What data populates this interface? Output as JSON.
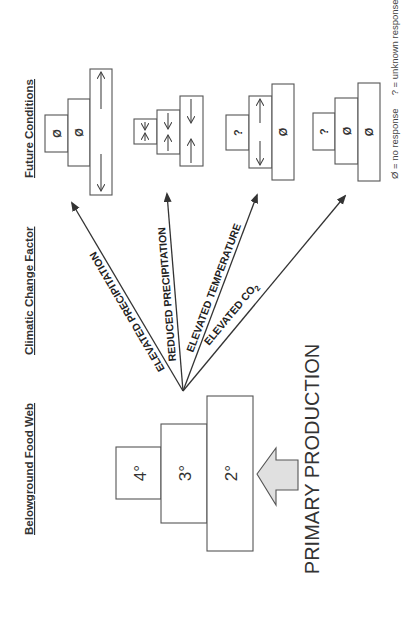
{
  "headers": {
    "food_web": "Belowground Food Web",
    "factor": "Climatic Change Factor",
    "future": "Future Conditions"
  },
  "food_web": {
    "levels": [
      {
        "label": "4°",
        "name": "quaternary-consumers"
      },
      {
        "label": "3°",
        "name": "tertiary-consumers"
      },
      {
        "label": "2°",
        "name": "secondary-consumers"
      }
    ],
    "input_label": "PRIMARY PRODUCTION",
    "input_arrow_color": "#e0e0e0"
  },
  "factors": [
    {
      "label": "ELEVATED PRECIPITATION"
    },
    {
      "label": "REDUCED PRECIPITATION"
    },
    {
      "label": "ELEVATED TEMPERATURE"
    },
    {
      "label_main": "ELEVATED CO",
      "label_sub": "2"
    }
  ],
  "future_conditions": [
    {
      "factor": "ELEVATED PRECIPITATION",
      "levels": {
        "4°": "Ø",
        "3°": "Ø",
        "2°": "increase/decrease (variable)"
      }
    },
    {
      "factor": "REDUCED PRECIPITATION",
      "levels": {
        "4°": "decrease/decrease",
        "3°": "decrease/decrease",
        "2°": "decrease/decrease"
      }
    },
    {
      "factor": "ELEVATED TEMPERATURE",
      "levels": {
        "4°": "?",
        "3°": "increase/decrease (variable)",
        "2°": "Ø"
      }
    },
    {
      "factor": "ELEVATED CO2",
      "levels": {
        "4°": "?",
        "3°": "Ø",
        "2°": "Ø"
      }
    }
  ],
  "symbols": {
    "no_response": "Ø",
    "unknown": "?"
  },
  "legend": {
    "text": "Ø = no response     ? = unknown response"
  }
}
